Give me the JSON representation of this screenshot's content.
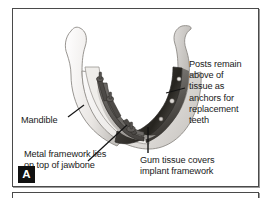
{
  "figure": {
    "panel_letter": "A",
    "annotations": [
      {
        "id": "posts",
        "text": "Posts remain\nabove of\ntissue as\nanchors for\nreplacement\nteeth"
      },
      {
        "id": "mandible",
        "text": "Mandible"
      },
      {
        "id": "metal_framework",
        "text": "Metal framework lies\non top of jawbone"
      },
      {
        "id": "gum_tissue",
        "text": "Gum tissue covers\nimplant framework"
      }
    ],
    "colors": {
      "frame_border": "#4a4a4a",
      "text": "#1a1a1a",
      "badge_background": "#111111",
      "badge_text": "#ffffff",
      "bone_light": "#f2f0ee",
      "bone_shadow": "#b9b6b2",
      "gum_dark": "#3c3a38",
      "framework_metal": "#5a5754",
      "background": "#ffffff"
    }
  }
}
